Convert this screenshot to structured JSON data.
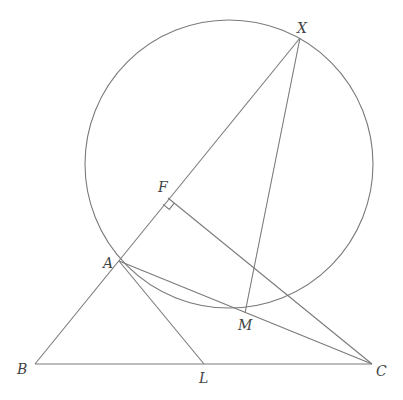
{
  "diagram": {
    "points": {
      "X": {
        "label": "X",
        "x": 300,
        "y": 38,
        "lx": 297,
        "ly": 33
      },
      "F": {
        "label": "F",
        "x": 168,
        "y": 198,
        "lx": 158,
        "ly": 192
      },
      "A": {
        "label": "A",
        "x": 119,
        "y": 261,
        "lx": 103,
        "ly": 268
      },
      "M": {
        "label": "M",
        "x": 245,
        "y": 313,
        "lx": 238,
        "ly": 330
      },
      "B": {
        "label": "B",
        "x": 35,
        "y": 364,
        "lx": 17,
        "ly": 374
      },
      "L": {
        "label": "L",
        "x": 204,
        "y": 364,
        "lx": 199,
        "ly": 383
      },
      "C": {
        "label": "C",
        "x": 372,
        "y": 364,
        "lx": 376,
        "ly": 376
      }
    },
    "circle": {
      "cx": 229,
      "cy": 164,
      "r": 144
    },
    "segments": [
      [
        "B",
        "X"
      ],
      [
        "B",
        "C"
      ],
      [
        "X",
        "M"
      ],
      [
        "A",
        "C"
      ],
      [
        "A",
        "L"
      ],
      [
        "F",
        "C"
      ]
    ],
    "right_angle_at": "F",
    "stroke_color": "#7a7a7a",
    "label_color": "#444444"
  }
}
